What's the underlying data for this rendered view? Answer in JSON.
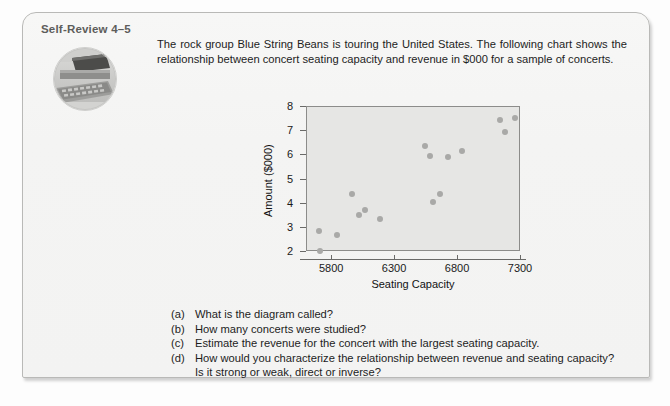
{
  "card": {
    "self_review_label": "Self-Review 4–5",
    "thumbnail_icon": "computer-photo"
  },
  "intro": {
    "line1": "The rock group Blue String Beans is touring the United States. The following chart shows",
    "line2": "the relationship between concert seating capacity and revenue in $000 for a sample of",
    "line3": "concerts."
  },
  "chart_data": {
    "type": "scatter",
    "title": "",
    "xlabel": "Seating Capacity",
    "ylabel": "Amount ($000)",
    "xlim": [
      5600,
      7300
    ],
    "ylim": [
      2,
      8
    ],
    "xticks": [
      5800,
      6300,
      6800,
      7300
    ],
    "yticks": [
      2,
      3,
      4,
      5,
      6,
      7,
      8
    ],
    "grid": false,
    "legend": "none",
    "point_color": "#a9a9a7",
    "plot_bg": "#e6e6e4",
    "points": [
      {
        "x": 5695,
        "y": 2.88
      },
      {
        "x": 5700,
        "y": 2.03
      },
      {
        "x": 5840,
        "y": 2.7
      },
      {
        "x": 5960,
        "y": 4.42
      },
      {
        "x": 6010,
        "y": 3.53
      },
      {
        "x": 6060,
        "y": 3.74
      },
      {
        "x": 6180,
        "y": 3.35
      },
      {
        "x": 6540,
        "y": 6.37
      },
      {
        "x": 6575,
        "y": 5.97
      },
      {
        "x": 6600,
        "y": 4.07
      },
      {
        "x": 6660,
        "y": 4.38
      },
      {
        "x": 6720,
        "y": 5.95
      },
      {
        "x": 6830,
        "y": 6.2
      },
      {
        "x": 7130,
        "y": 7.45
      },
      {
        "x": 7175,
        "y": 6.95
      },
      {
        "x": 7250,
        "y": 7.55
      }
    ]
  },
  "questions": [
    {
      "marker": "(a)",
      "text": "What is the diagram called?",
      "cont": ""
    },
    {
      "marker": "(b)",
      "text": "How many concerts were studied?",
      "cont": ""
    },
    {
      "marker": "(c)",
      "text": "Estimate the revenue for the concert with the largest seating capacity.",
      "cont": ""
    },
    {
      "marker": "(d)",
      "text": "How would you characterize the relationship between revenue and seating capacity?",
      "cont": "Is it strong or weak, direct or inverse?"
    }
  ]
}
